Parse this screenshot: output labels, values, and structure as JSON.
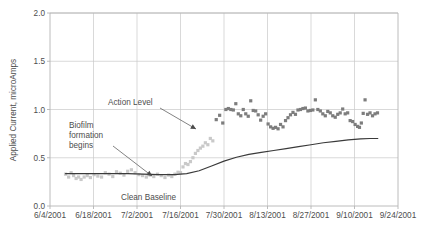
{
  "chart_data": {
    "type": "scatter",
    "title": "",
    "subtitle": "",
    "xlabel": "",
    "ylabel": "Applied Current, microAmps",
    "ylim": [
      0.0,
      2.0
    ],
    "yticks": [
      "0.0",
      "0.5",
      "1.0",
      "1.5",
      "2.0"
    ],
    "ytick_values": [
      0.0,
      0.5,
      1.0,
      1.5,
      2.0
    ],
    "xlim": [
      "6/4/2001",
      "9/24/2001"
    ],
    "xticks": [
      "6/4/2001",
      "6/18/2001",
      "7/2/2001",
      "7/16/2001",
      "7/30/2001",
      "8/13/2001",
      "8/27/2001",
      "9/10/2001",
      "9/24/2001"
    ],
    "xtick_days": [
      0,
      14,
      28,
      42,
      56,
      70,
      84,
      98,
      112
    ],
    "grid": true,
    "legend": "none",
    "colors": {
      "baseline_marker": "#c9c9c9",
      "elevated_marker": "#7d7d7d",
      "trend_line": "#3a3a3a",
      "gridline": "#c9c9c9",
      "axis": "#b4b4b4",
      "text": "#4d4d4d"
    },
    "series": [
      {
        "name": "Clean Baseline / transition",
        "marker": "square",
        "color": "#c9c9c9",
        "points": [
          {
            "x": 5.0,
            "y": 0.33
          },
          {
            "x": 6.0,
            "y": 0.3
          },
          {
            "x": 6.8,
            "y": 0.345
          },
          {
            "x": 7.6,
            "y": 0.315
          },
          {
            "x": 8.4,
            "y": 0.285
          },
          {
            "x": 9.2,
            "y": 0.3
          },
          {
            "x": 10.0,
            "y": 0.275
          },
          {
            "x": 11.0,
            "y": 0.3
          },
          {
            "x": 12.0,
            "y": 0.315
          },
          {
            "x": 13.0,
            "y": 0.295
          },
          {
            "x": 14.2,
            "y": 0.325
          },
          {
            "x": 15.4,
            "y": 0.31
          },
          {
            "x": 16.6,
            "y": 0.3
          },
          {
            "x": 17.8,
            "y": 0.345
          },
          {
            "x": 19.0,
            "y": 0.33
          },
          {
            "x": 20.2,
            "y": 0.305
          },
          {
            "x": 21.4,
            "y": 0.355
          },
          {
            "x": 22.6,
            "y": 0.34
          },
          {
            "x": 23.8,
            "y": 0.32
          },
          {
            "x": 25.0,
            "y": 0.36
          },
          {
            "x": 26.2,
            "y": 0.375
          },
          {
            "x": 27.4,
            "y": 0.345
          },
          {
            "x": 28.6,
            "y": 0.325
          },
          {
            "x": 29.8,
            "y": 0.315
          },
          {
            "x": 31.0,
            "y": 0.3
          },
          {
            "x": 32.2,
            "y": 0.32
          },
          {
            "x": 33.4,
            "y": 0.305
          },
          {
            "x": 34.6,
            "y": 0.33
          },
          {
            "x": 35.8,
            "y": 0.315
          },
          {
            "x": 37.0,
            "y": 0.295
          },
          {
            "x": 38.2,
            "y": 0.32
          },
          {
            "x": 39.2,
            "y": 0.305
          },
          {
            "x": 40.2,
            "y": 0.33
          },
          {
            "x": 41.2,
            "y": 0.35
          },
          {
            "x": 42.0,
            "y": 0.345
          },
          {
            "x": 42.8,
            "y": 0.405
          },
          {
            "x": 43.6,
            "y": 0.44
          },
          {
            "x": 44.4,
            "y": 0.43
          },
          {
            "x": 45.2,
            "y": 0.46
          },
          {
            "x": 46.0,
            "y": 0.5
          },
          {
            "x": 46.8,
            "y": 0.545
          },
          {
            "x": 47.6,
            "y": 0.575
          },
          {
            "x": 48.4,
            "y": 0.6
          },
          {
            "x": 49.2,
            "y": 0.62
          },
          {
            "x": 50.0,
            "y": 0.655
          },
          {
            "x": 50.8,
            "y": 0.635
          },
          {
            "x": 51.6,
            "y": 0.7
          },
          {
            "x": 52.4,
            "y": 0.675
          }
        ]
      },
      {
        "name": "Elevated applied current",
        "marker": "square",
        "color": "#7d7d7d",
        "points": [
          {
            "x": 53.5,
            "y": 0.895
          },
          {
            "x": 54.6,
            "y": 0.94
          },
          {
            "x": 55.6,
            "y": 0.86
          },
          {
            "x": 56.6,
            "y": 1.0
          },
          {
            "x": 57.4,
            "y": 1.01
          },
          {
            "x": 58.2,
            "y": 1.0
          },
          {
            "x": 59.0,
            "y": 0.995
          },
          {
            "x": 59.8,
            "y": 1.06
          },
          {
            "x": 60.6,
            "y": 0.955
          },
          {
            "x": 61.4,
            "y": 0.935
          },
          {
            "x": 62.2,
            "y": 1.0
          },
          {
            "x": 63.0,
            "y": 0.955
          },
          {
            "x": 63.8,
            "y": 0.93
          },
          {
            "x": 64.6,
            "y": 1.09
          },
          {
            "x": 65.4,
            "y": 0.99
          },
          {
            "x": 66.2,
            "y": 0.985
          },
          {
            "x": 67.0,
            "y": 0.945
          },
          {
            "x": 67.8,
            "y": 0.89
          },
          {
            "x": 68.6,
            "y": 0.93
          },
          {
            "x": 69.4,
            "y": 0.955
          },
          {
            "x": 70.2,
            "y": 0.85
          },
          {
            "x": 71.0,
            "y": 0.82
          },
          {
            "x": 71.8,
            "y": 0.805
          },
          {
            "x": 72.6,
            "y": 0.815
          },
          {
            "x": 73.4,
            "y": 0.8
          },
          {
            "x": 74.2,
            "y": 0.845
          },
          {
            "x": 75.0,
            "y": 0.82
          },
          {
            "x": 75.8,
            "y": 0.885
          },
          {
            "x": 76.6,
            "y": 0.915
          },
          {
            "x": 77.4,
            "y": 0.945
          },
          {
            "x": 78.2,
            "y": 0.97
          },
          {
            "x": 79.0,
            "y": 0.95
          },
          {
            "x": 79.8,
            "y": 0.995
          },
          {
            "x": 80.6,
            "y": 1.0
          },
          {
            "x": 81.4,
            "y": 1.01
          },
          {
            "x": 82.2,
            "y": 1.015
          },
          {
            "x": 83.0,
            "y": 0.985
          },
          {
            "x": 83.8,
            "y": 0.99
          },
          {
            "x": 84.6,
            "y": 0.995
          },
          {
            "x": 85.4,
            "y": 1.1
          },
          {
            "x": 86.2,
            "y": 1.0
          },
          {
            "x": 87.0,
            "y": 0.985
          },
          {
            "x": 87.8,
            "y": 0.955
          },
          {
            "x": 88.6,
            "y": 0.935
          },
          {
            "x": 89.4,
            "y": 0.98
          },
          {
            "x": 90.2,
            "y": 0.965
          },
          {
            "x": 91.0,
            "y": 0.935
          },
          {
            "x": 91.8,
            "y": 0.92
          },
          {
            "x": 92.6,
            "y": 0.95
          },
          {
            "x": 93.4,
            "y": 0.965
          },
          {
            "x": 94.2,
            "y": 1.005
          },
          {
            "x": 95.0,
            "y": 0.955
          },
          {
            "x": 95.8,
            "y": 0.965
          },
          {
            "x": 96.6,
            "y": 0.885
          },
          {
            "x": 97.4,
            "y": 0.875
          },
          {
            "x": 98.2,
            "y": 0.845
          },
          {
            "x": 99.0,
            "y": 0.825
          },
          {
            "x": 99.6,
            "y": 0.815
          },
          {
            "x": 100.2,
            "y": 0.86
          },
          {
            "x": 100.8,
            "y": 0.96
          },
          {
            "x": 101.4,
            "y": 1.1
          },
          {
            "x": 102.2,
            "y": 0.95
          },
          {
            "x": 103.0,
            "y": 0.965
          },
          {
            "x": 103.8,
            "y": 0.935
          },
          {
            "x": 104.6,
            "y": 0.955
          },
          {
            "x": 105.4,
            "y": 0.965
          }
        ]
      }
    ],
    "trend_line": {
      "name": "Smoothed trend",
      "color": "#3a3a3a",
      "points": [
        {
          "x": 5.0,
          "y": 0.335
        },
        {
          "x": 10.0,
          "y": 0.335
        },
        {
          "x": 15.0,
          "y": 0.335
        },
        {
          "x": 20.0,
          "y": 0.335
        },
        {
          "x": 25.0,
          "y": 0.335
        },
        {
          "x": 30.0,
          "y": 0.33
        },
        {
          "x": 35.0,
          "y": 0.325
        },
        {
          "x": 40.0,
          "y": 0.325
        },
        {
          "x": 44.0,
          "y": 0.335
        },
        {
          "x": 48.0,
          "y": 0.365
        },
        {
          "x": 52.0,
          "y": 0.415
        },
        {
          "x": 56.0,
          "y": 0.465
        },
        {
          "x": 60.0,
          "y": 0.505
        },
        {
          "x": 64.0,
          "y": 0.535
        },
        {
          "x": 68.0,
          "y": 0.555
        },
        {
          "x": 72.0,
          "y": 0.575
        },
        {
          "x": 76.0,
          "y": 0.595
        },
        {
          "x": 80.0,
          "y": 0.615
        },
        {
          "x": 84.0,
          "y": 0.635
        },
        {
          "x": 88.0,
          "y": 0.655
        },
        {
          "x": 92.0,
          "y": 0.67
        },
        {
          "x": 96.0,
          "y": 0.685
        },
        {
          "x": 100.0,
          "y": 0.695
        },
        {
          "x": 103.0,
          "y": 0.7
        },
        {
          "x": 105.5,
          "y": 0.7
        }
      ]
    },
    "annotations": [
      {
        "id": "action-level",
        "text": "Action Level",
        "text_x": 108,
        "text_y": 105,
        "arrow_from_x": 160,
        "arrow_from_y": 108,
        "arrow_to_x": 196,
        "arrow_to_y": 129
      },
      {
        "id": "biofilm-formation",
        "text_lines": [
          "Biofilm",
          "formation",
          "begins"
        ],
        "text_x": 69,
        "text_y": 128,
        "arrow_from_x": 113,
        "arrow_from_y": 146,
        "arrow_to_x": 152,
        "arrow_to_y": 176
      },
      {
        "id": "clean-baseline",
        "text": "Clean Baseline",
        "text_x": 121,
        "text_y": 200
      }
    ]
  }
}
